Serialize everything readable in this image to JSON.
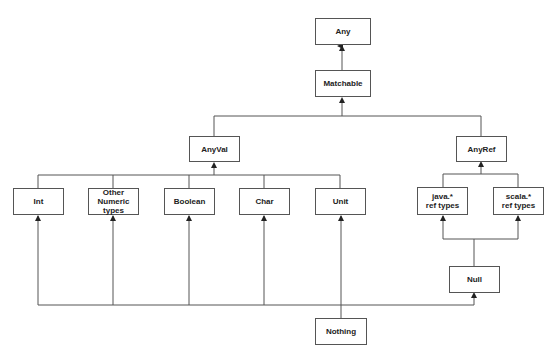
{
  "diagram": {
    "title": "",
    "stroke_color": "#555555",
    "nodes": {
      "any": {
        "label": "Any"
      },
      "matchable": {
        "label": "Matchable"
      },
      "anyval": {
        "label": "AnyVal"
      },
      "anyref": {
        "label": "AnyRef"
      },
      "int": {
        "label": "Int"
      },
      "other_numeric": {
        "label": "Other\nNumeric\ntypes"
      },
      "boolean": {
        "label": "Boolean"
      },
      "char": {
        "label": "Char"
      },
      "unit": {
        "label": "Unit"
      },
      "java_ref": {
        "label": "java.*\nref types"
      },
      "scala_ref": {
        "label": "scala.*\nref types"
      },
      "null": {
        "label": "Null"
      },
      "nothing": {
        "label": "Nothing"
      }
    },
    "edges": [
      {
        "from": "Matchable",
        "to": "Any"
      },
      {
        "from": "AnyVal",
        "to": "Matchable"
      },
      {
        "from": "AnyRef",
        "to": "Matchable"
      },
      {
        "from": "Int",
        "to": "AnyVal"
      },
      {
        "from": "Other Numeric types",
        "to": "AnyVal"
      },
      {
        "from": "Boolean",
        "to": "AnyVal"
      },
      {
        "from": "Char",
        "to": "AnyVal"
      },
      {
        "from": "Unit",
        "to": "AnyVal"
      },
      {
        "from": "java.* ref types",
        "to": "AnyRef"
      },
      {
        "from": "scala.* ref types",
        "to": "AnyRef"
      },
      {
        "from": "Null",
        "to": "java.* ref types"
      },
      {
        "from": "Null",
        "to": "scala.* ref types"
      },
      {
        "from": "Nothing",
        "to": "Int"
      },
      {
        "from": "Nothing",
        "to": "Other Numeric types"
      },
      {
        "from": "Nothing",
        "to": "Boolean"
      },
      {
        "from": "Nothing",
        "to": "Char"
      },
      {
        "from": "Nothing",
        "to": "Unit"
      },
      {
        "from": "Nothing",
        "to": "Null"
      }
    ]
  }
}
